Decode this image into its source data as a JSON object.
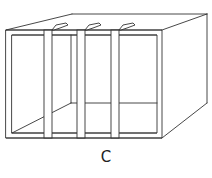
{
  "figure": {
    "line_color": "#333333",
    "background": "#ffffff",
    "strap_count": 3
  },
  "caption": {
    "label": "C"
  }
}
